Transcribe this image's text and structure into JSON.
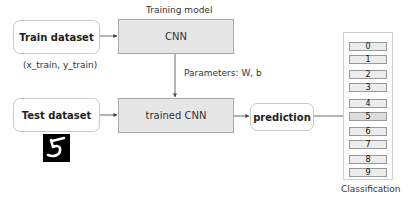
{
  "diagram": {
    "train_dataset": {
      "label": "Train dataset",
      "caption": "(x_train, y_train)"
    },
    "training_model": {
      "title": "Training model",
      "box_label": "CNN"
    },
    "parameters_label": "Parameters:  W, b",
    "test_dataset": {
      "label": "Test dataset",
      "sample_image": "handwritten-digit-5"
    },
    "trained_model": {
      "box_label": "trained CNN"
    },
    "prediction": {
      "label": "prediction"
    },
    "classification": {
      "caption": "Classification",
      "classes": [
        "0",
        "1",
        "2",
        "3",
        "4",
        "5",
        "6",
        "7",
        "8",
        "9"
      ],
      "selected": "5"
    },
    "colors": {
      "model_box_fill": "#e6e6e6",
      "model_box_border": "#a8a8a8",
      "rounded_box_border": "#c8c8c8",
      "arrow": "#444444"
    }
  }
}
